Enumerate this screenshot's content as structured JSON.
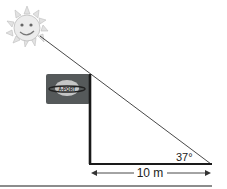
{
  "diagram": {
    "type": "right-triangle-shadow-problem",
    "angle_label": "37°",
    "angle_value_deg": 37,
    "distance_label": "10 m",
    "distance_value_m": 10,
    "flag": {
      "logo_text": "A-PORT",
      "color": "#55595a"
    },
    "sun": {
      "color": "#d8d8d8",
      "face": true
    },
    "colors": {
      "line": "#333333",
      "pole": "#1a1a1a",
      "ground": "#555555"
    }
  }
}
